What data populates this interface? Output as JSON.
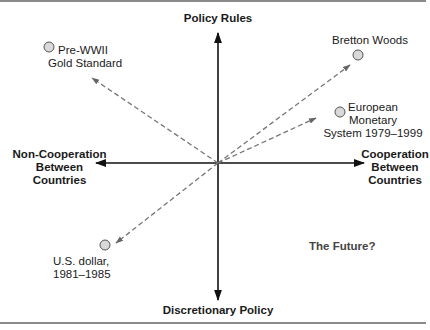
{
  "axes": {
    "top": "Policy Rules",
    "bottom": "Discretionary Policy",
    "left": "Non-Cooperation\nBetween\nCountries",
    "right": "Cooperation\nBetween\nCountries"
  },
  "points": [
    {
      "label": "Pre-WWII\nGold Standard",
      "quadrant": "rules / non-cooperation"
    },
    {
      "label": "Bretton Woods",
      "quadrant": "rules / cooperation"
    },
    {
      "label": "European\nMonetary\nSystem 1979–1999",
      "quadrant": "rules / cooperation"
    },
    {
      "label": "U.S. dollar,\n1981–1985",
      "quadrant": "discretion / non-cooperation"
    }
  ],
  "annotation": "The Future?",
  "colors": {
    "axis": "#111111",
    "dashed_arrow": "#777777",
    "circle_fill": "#d9d9d9",
    "circle_stroke": "#555555",
    "rule": "#8a8a8a"
  }
}
